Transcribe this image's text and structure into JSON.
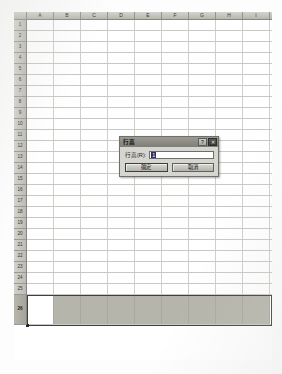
{
  "application": {
    "name": "Excel Worksheet",
    "locale": "zh-CN"
  },
  "spreadsheet": {
    "corner_label": "",
    "columns": [
      {
        "label": "A",
        "width": 27
      },
      {
        "label": "B",
        "width": 27
      },
      {
        "label": "C",
        "width": 27
      },
      {
        "label": "D",
        "width": 27
      },
      {
        "label": "E",
        "width": 27
      },
      {
        "label": "F",
        "width": 27
      },
      {
        "label": "G",
        "width": 27
      },
      {
        "label": "H",
        "width": 27
      },
      {
        "label": "I",
        "width": 27
      }
    ],
    "rows": [
      {
        "label": "1",
        "height": 11,
        "selected": false
      },
      {
        "label": "2",
        "height": 11,
        "selected": false
      },
      {
        "label": "3",
        "height": 11,
        "selected": false
      },
      {
        "label": "4",
        "height": 11,
        "selected": false
      },
      {
        "label": "5",
        "height": 11,
        "selected": false
      },
      {
        "label": "6",
        "height": 11,
        "selected": false
      },
      {
        "label": "7",
        "height": 11,
        "selected": false
      },
      {
        "label": "8",
        "height": 11,
        "selected": false
      },
      {
        "label": "9",
        "height": 11,
        "selected": false
      },
      {
        "label": "10",
        "height": 11,
        "selected": false
      },
      {
        "label": "11",
        "height": 11,
        "selected": false
      },
      {
        "label": "12",
        "height": 11,
        "selected": false
      },
      {
        "label": "13",
        "height": 11,
        "selected": false
      },
      {
        "label": "14",
        "height": 11,
        "selected": false
      },
      {
        "label": "15",
        "height": 11,
        "selected": false
      },
      {
        "label": "16",
        "height": 11,
        "selected": false
      },
      {
        "label": "17",
        "height": 11,
        "selected": false
      },
      {
        "label": "18",
        "height": 11,
        "selected": false
      },
      {
        "label": "19",
        "height": 11,
        "selected": false
      },
      {
        "label": "20",
        "height": 11,
        "selected": false
      },
      {
        "label": "21",
        "height": 11,
        "selected": false
      },
      {
        "label": "22",
        "height": 11,
        "selected": false
      },
      {
        "label": "23",
        "height": 11,
        "selected": false
      },
      {
        "label": "24",
        "height": 11,
        "selected": false
      },
      {
        "label": "25",
        "height": 11,
        "selected": false
      },
      {
        "label": "26",
        "height": 30,
        "selected": true
      }
    ],
    "selection": {
      "selected_row_label": "26",
      "active_cell_column": "A",
      "selection_border_color": "#3f3f3c",
      "selection_fill_color": "#b5b5ab"
    }
  },
  "dialog": {
    "title": "行高",
    "help_button_label": "?",
    "close_button_label": "✕",
    "field": {
      "label": "行高(R):",
      "value": "1",
      "placeholder": ""
    },
    "buttons": {
      "ok_label": "确定",
      "cancel_label": "取消"
    }
  },
  "colors": {
    "header_gray": "#c6c6c0",
    "grid_line": "#cfcfcb",
    "dialog_face": "#d6d6d0",
    "titlebar": "#8b8b84",
    "selection_highlight": "#2d2d6e"
  }
}
